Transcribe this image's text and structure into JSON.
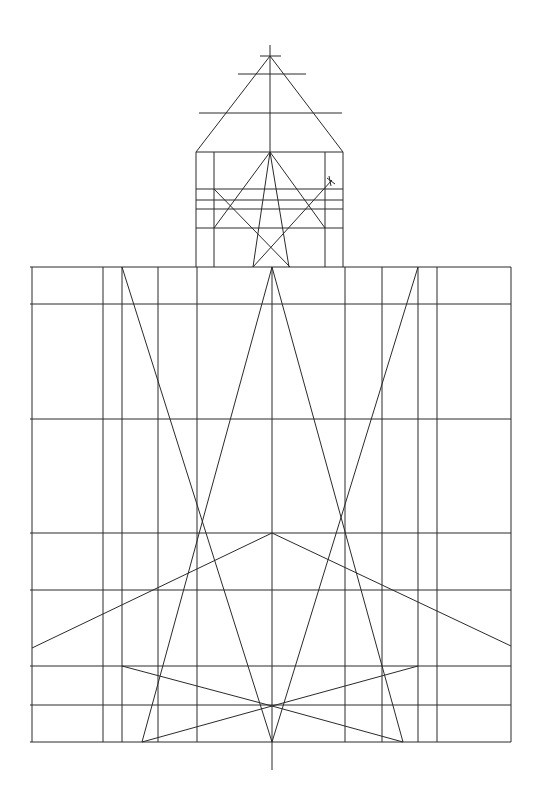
{
  "colors": {
    "background": "#ffffff",
    "stroke": "#2a2a2a"
  },
  "spire": {
    "lines": [
      [
        270,
        45,
        270,
        152
      ],
      [
        260,
        56,
        281,
        56
      ],
      [
        238,
        74,
        306,
        74
      ],
      [
        199,
        113,
        342,
        113
      ],
      [
        270,
        56,
        196,
        152
      ],
      [
        270,
        56,
        343,
        152
      ]
    ]
  },
  "tower": {
    "lines": [
      [
        196,
        152,
        343,
        152
      ],
      [
        196,
        152,
        196,
        267
      ],
      [
        343,
        152,
        343,
        267
      ],
      [
        214,
        152,
        214,
        267
      ],
      [
        325,
        152,
        325,
        267
      ],
      [
        196,
        189,
        343,
        189
      ],
      [
        196,
        200,
        343,
        200
      ],
      [
        196,
        209,
        343,
        209
      ],
      [
        196,
        228,
        343,
        228
      ],
      [
        270,
        152,
        214,
        228
      ],
      [
        270,
        152,
        325,
        228
      ],
      [
        214,
        189,
        290,
        267
      ],
      [
        270,
        152,
        253,
        267
      ],
      [
        270,
        152,
        289,
        267
      ],
      [
        253,
        267,
        332,
        180
      ],
      [
        327,
        178,
        335,
        184
      ],
      [
        329,
        176,
        331,
        186
      ]
    ]
  },
  "base": {
    "lines": [
      [
        30,
        267,
        511,
        267
      ],
      [
        30,
        304,
        511,
        304
      ],
      [
        30,
        419,
        511,
        419
      ],
      [
        30,
        533,
        511,
        533
      ],
      [
        30,
        590,
        511,
        590
      ],
      [
        30,
        666,
        511,
        666
      ],
      [
        30,
        705,
        511,
        705
      ],
      [
        30,
        742,
        511,
        742
      ],
      [
        32,
        267,
        32,
        742
      ],
      [
        103,
        267,
        103,
        742
      ],
      [
        122,
        267,
        122,
        742
      ],
      [
        158,
        267,
        158,
        742
      ],
      [
        197,
        267,
        197,
        742
      ],
      [
        272,
        267,
        272,
        770
      ],
      [
        345,
        267,
        345,
        742
      ],
      [
        382,
        267,
        382,
        742
      ],
      [
        418,
        267,
        418,
        742
      ],
      [
        437,
        267,
        437,
        742
      ],
      [
        511,
        267,
        511,
        742
      ],
      [
        122,
        267,
        272,
        742
      ],
      [
        418,
        267,
        272,
        742
      ],
      [
        272,
        267,
        142,
        742
      ],
      [
        272,
        267,
        403,
        742
      ],
      [
        32,
        648,
        272,
        533
      ],
      [
        272,
        533,
        511,
        646
      ],
      [
        122,
        666,
        272,
        706
      ],
      [
        418,
        666,
        272,
        706
      ],
      [
        142,
        742,
        272,
        706
      ],
      [
        272,
        706,
        403,
        742
      ]
    ]
  }
}
